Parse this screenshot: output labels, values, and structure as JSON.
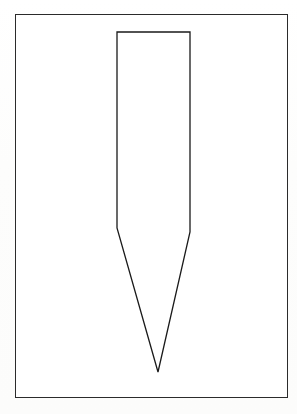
{
  "page": {
    "background_color": "#fdfdfd",
    "width": 297,
    "height": 414
  },
  "figure": {
    "frame": {
      "x": 15,
      "y": 14,
      "width": 273,
      "height": 384,
      "stroke_color": "#2b2b2b",
      "stroke_width": 1.6,
      "fill_color": "#ffffff"
    },
    "drawing": {
      "name": "tapered-projectile-outline",
      "description": "Line drawing of a long rectangular body that tapers from shoulders down to a sharp V point",
      "stroke_color": "#1a1a1a",
      "stroke_width": 1.3,
      "fill_color": "none",
      "vertices": [
        {
          "label": "top-left",
          "x": 117,
          "y": 32
        },
        {
          "label": "top-right",
          "x": 190,
          "y": 32
        },
        {
          "label": "right-shoulder",
          "x": 190,
          "y": 232
        },
        {
          "label": "tip",
          "x": 158,
          "y": 372
        },
        {
          "label": "left-shoulder",
          "x": 117,
          "y": 228
        }
      ],
      "body_width": 73,
      "body_top_y": 32,
      "shoulder_y_left": 228,
      "shoulder_y_right": 232,
      "tip_x": 158,
      "tip_y": 372
    }
  },
  "caption": {
    "text": "",
    "visible": true,
    "clipped": true,
    "note": "caption line is cut off at the bottom edge of the scan; glyph tops only"
  }
}
